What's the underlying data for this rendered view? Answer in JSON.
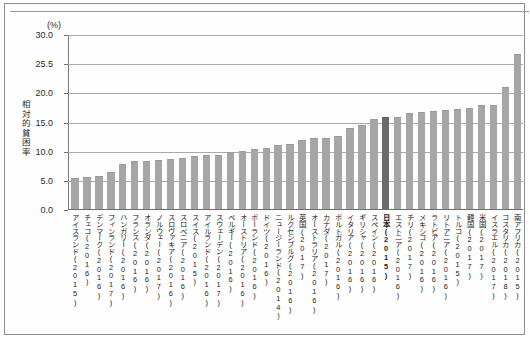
{
  "figure": {
    "unit_label": "(%)",
    "y_axis_title": "相対的貧困率"
  },
  "chart_data": {
    "type": "bar",
    "title": "",
    "subtitle": "",
    "xlabel": "",
    "ylabel": "相対的貧困率",
    "unit": "(%)",
    "ylim": [
      0.0,
      30.0
    ],
    "ytick_labels": [
      "30.0",
      "25.5",
      "20.0",
      "15.0",
      "10.0",
      "5.0",
      "0.0"
    ],
    "ytick_values": [
      30.0,
      25.0,
      20.0,
      15.0,
      10.0,
      5.0,
      0.0
    ],
    "grid": "horizontal",
    "legend": "none",
    "highlight_category": "日本(2015)",
    "highlight_color": "#6a6a6a",
    "bar_color": "#a6a6a6",
    "categories": [
      "アイスランド(2015)",
      "チェコ(2016)",
      "デンマーク(2016)",
      "フィンランド(2017)",
      "ハンガリー(2016)",
      "フランス(2016)",
      "オランダ(2016)",
      "ノルウェー(2017)",
      "スロヴァキア(2016)",
      "スロベニア(2016)",
      "スイス(2015)",
      "アイルランド(2016)",
      "スウェーデン(2017)",
      "ベルギー(2016)",
      "オーストリア(2016)",
      "ポーランド(2016)",
      "ドイツ(2016)",
      "ニュージーランド(2014)",
      "ルクセンブルグ(2016)",
      "英国(2017)",
      "オーストラリア(2016)",
      "カナダ(2017)",
      "ポルトガル(2016)",
      "イタリア(2016)",
      "ギリシャ(2016)",
      "スペイン(2016)",
      "日本(2015)",
      "エストニア(2016)",
      "チリ(2017)",
      "メキシコ(2016)",
      "ラトビア(2016)",
      "リトアニア(2016)",
      "トルコ(2015)",
      "韓国(2017)",
      "米国(2017)",
      "イスラエル(2017)",
      "コスタリカ(2018)",
      "南アフリカ(2015)"
    ],
    "values": [
      5.3,
      5.5,
      5.6,
      6.3,
      7.8,
      8.3,
      8.3,
      8.4,
      8.5,
      8.7,
      9.1,
      9.3,
      9.3,
      9.8,
      10.0,
      10.3,
      10.4,
      10.9,
      11.1,
      11.9,
      12.1,
      12.1,
      12.5,
      13.9,
      14.4,
      15.5,
      15.7,
      15.7,
      16.5,
      16.6,
      16.8,
      17.0,
      17.2,
      17.4,
      17.8,
      17.9,
      20.9,
      26.6
    ]
  }
}
